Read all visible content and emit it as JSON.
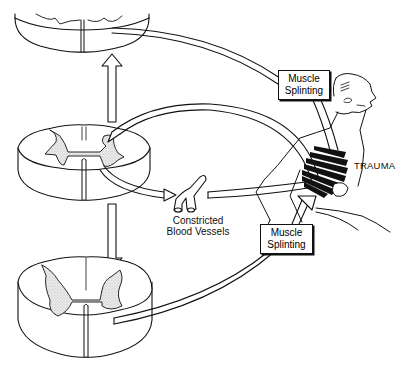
{
  "diagram": {
    "title": "",
    "labels": {
      "muscle_splinting_upper": [
        "Muscle",
        "Splinting"
      ],
      "muscle_splinting_lower": [
        "Muscle",
        "Splinting"
      ],
      "trauma": "TRAUMA",
      "constricted_blood_vessels": [
        "Constricted",
        "Blood Vessels"
      ]
    },
    "nodes": [
      {
        "id": "spinal-cord-upper",
        "label": ""
      },
      {
        "id": "spinal-cord-middle",
        "label": ""
      },
      {
        "id": "spinal-cord-lower",
        "label": ""
      },
      {
        "id": "blood-vessels",
        "label": "Constricted Blood Vessels"
      },
      {
        "id": "muscle-splinting-upper",
        "label": "Muscle Splinting"
      },
      {
        "id": "muscle-splinting-lower",
        "label": "Muscle Splinting"
      },
      {
        "id": "trauma-figure",
        "label": "TRAUMA"
      }
    ],
    "edges": [
      {
        "from": "spinal-cord-middle",
        "to": "spinal-cord-upper"
      },
      {
        "from": "spinal-cord-middle",
        "to": "spinal-cord-lower"
      },
      {
        "from": "spinal-cord-upper",
        "to": "muscle-splinting-upper"
      },
      {
        "from": "muscle-splinting-upper",
        "to": "trauma-figure"
      },
      {
        "from": "trauma-figure",
        "to": "spinal-cord-middle"
      },
      {
        "from": "spinal-cord-middle",
        "to": "blood-vessels"
      },
      {
        "from": "blood-vessels",
        "to": "trauma-figure"
      },
      {
        "from": "spinal-cord-lower",
        "to": "muscle-splinting-lower"
      },
      {
        "from": "muscle-splinting-lower",
        "to": "trauma-figure"
      }
    ],
    "colors": {
      "ink": "#111111",
      "background": "#ffffff",
      "stipple": "#d8d8d8"
    }
  }
}
